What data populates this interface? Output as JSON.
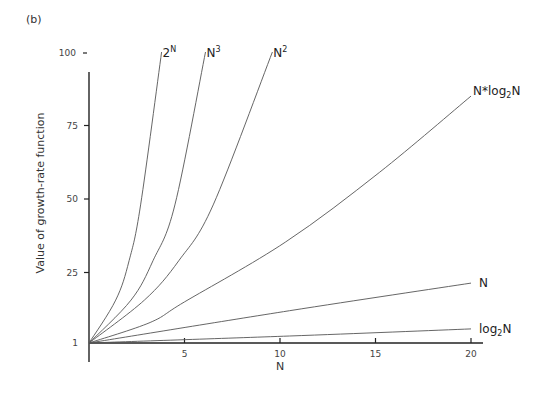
{
  "panel_label": "(b)",
  "chart_data": {
    "type": "line",
    "title": "",
    "xlabel": "N",
    "ylabel": "Value of growth-rate function",
    "xlim": [
      0,
      20.6
    ],
    "ylim": [
      1,
      100
    ],
    "grid": false,
    "legend": "none (labels at line ends)",
    "x_ticks": [
      {
        "value": 5,
        "label": "5"
      },
      {
        "value": 10,
        "label": "10"
      },
      {
        "value": 15,
        "label": "15"
      },
      {
        "value": 20,
        "label": "20"
      }
    ],
    "y_ticks": [
      {
        "value": 1,
        "label": "1"
      },
      {
        "value": 25,
        "label": "25"
      },
      {
        "value": 50,
        "label": "50"
      },
      {
        "value": 75,
        "label": "75"
      },
      {
        "value": 100,
        "label": "100"
      }
    ],
    "series": [
      {
        "name": "2^N",
        "label_main": "2",
        "label_sup": "N",
        "label_sub": "",
        "label_tail": "",
        "x": [
          0,
          1.4,
          2.1,
          2.7,
          3.8
        ],
        "values": [
          1,
          15.6,
          29,
          48,
          100
        ]
      },
      {
        "name": "N^3",
        "label_main": "N",
        "label_sup": "3",
        "label_sub": "",
        "label_tail": "",
        "x": [
          0,
          2.2,
          3.35,
          4.5,
          6.1
        ],
        "values": [
          1,
          15.6,
          29,
          48,
          100
        ]
      },
      {
        "name": "N^2",
        "label_main": "N",
        "label_sup": "2",
        "label_sub": "",
        "label_tail": "",
        "x": [
          0,
          2.9,
          4.7,
          6.5,
          9.6
        ],
        "values": [
          1,
          15.6,
          29,
          48,
          100
        ]
      },
      {
        "name": "N*log2N",
        "label_main": "N*log",
        "label_sup": "",
        "label_sub": "2",
        "label_tail": "N",
        "x": [
          0,
          3.2,
          5,
          10.3,
          15.2,
          20
        ],
        "values": [
          1,
          8,
          15,
          35.4,
          59,
          85
        ]
      },
      {
        "name": "N",
        "label_main": "N",
        "label_sup": "",
        "label_sub": "",
        "label_tail": "",
        "x": [
          0,
          10.5,
          20
        ],
        "values": [
          1,
          12,
          21.4
        ]
      },
      {
        "name": "log2N",
        "label_main": "log",
        "label_sup": "",
        "label_sub": "2",
        "label_tail": "N",
        "x": [
          0,
          10.5,
          20
        ],
        "values": [
          1,
          3.4,
          5.8
        ]
      }
    ]
  }
}
